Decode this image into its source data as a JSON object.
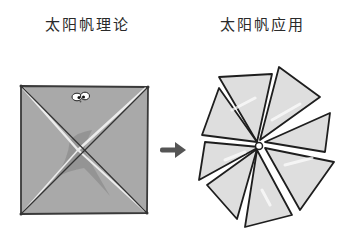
{
  "diagram": {
    "left_panel": {
      "title": "太阳帆理论",
      "shape": "square-sail-with-diagonal-creases",
      "fill_color": "#a6a6a6",
      "decoration": "cartoon-eyes"
    },
    "connector": {
      "type": "arrow-right",
      "color": "#555555"
    },
    "right_panel": {
      "title": "太阳帆应用",
      "shape": "pinwheel-sail",
      "segment_count": 8,
      "fill_color": "#dcdcdc"
    }
  }
}
